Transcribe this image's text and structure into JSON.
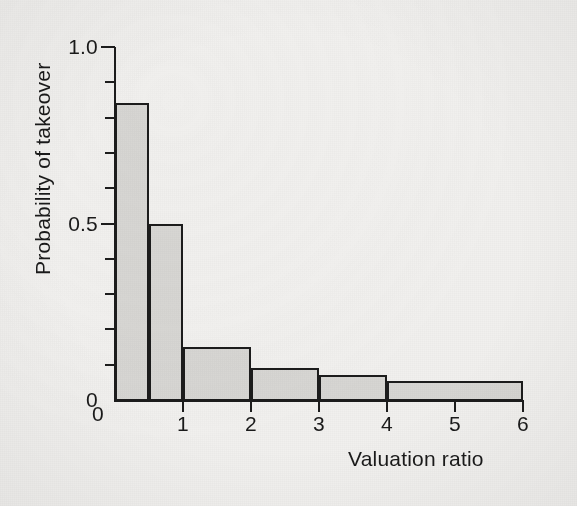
{
  "chart_data": {
    "type": "bar",
    "title": "",
    "subtitle": "",
    "xlabel": "Valuation ratio",
    "ylabel": "Probability of takeover",
    "xlim": [
      0,
      6
    ],
    "ylim": [
      0,
      1.0
    ],
    "grid": false,
    "legend": null,
    "orientation": "vertical",
    "note": "Histogram with unequal bin widths; bar value = probability of takeover for that valuation-ratio bin",
    "bins": [
      {
        "label": "0-0.5",
        "x0": 0,
        "x1": 0.5,
        "value": 0.84
      },
      {
        "label": "0.5-1",
        "x0": 0.5,
        "x1": 1,
        "value": 0.5
      },
      {
        "label": "1-2",
        "x0": 1,
        "x1": 2,
        "value": 0.15
      },
      {
        "label": "2-3",
        "x0": 2,
        "x1": 3,
        "value": 0.09
      },
      {
        "label": "3-4",
        "x0": 3,
        "x1": 4,
        "value": 0.07
      },
      {
        "label": "4-6",
        "x0": 4,
        "x1": 6,
        "value": 0.055
      }
    ],
    "categories": [
      "0-0.5",
      "0.5-1",
      "1-2",
      "2-3",
      "3-4",
      "4-6"
    ],
    "values": [
      0.84,
      0.5,
      0.15,
      0.09,
      0.07,
      0.055
    ],
    "x_ticks": [
      {
        "value": 0,
        "label": "0"
      },
      {
        "value": 1,
        "label": "1"
      },
      {
        "value": 2,
        "label": "2"
      },
      {
        "value": 3,
        "label": "3"
      },
      {
        "value": 4,
        "label": "4"
      },
      {
        "value": 5,
        "label": "5"
      },
      {
        "value": 6,
        "label": "6"
      }
    ],
    "y_ticks": [
      {
        "value": 0.0,
        "label": "0",
        "major": true
      },
      {
        "value": 0.1,
        "label": "",
        "major": false
      },
      {
        "value": 0.2,
        "label": "",
        "major": false
      },
      {
        "value": 0.3,
        "label": "",
        "major": false
      },
      {
        "value": 0.4,
        "label": "",
        "major": false
      },
      {
        "value": 0.5,
        "label": "0.5",
        "major": true
      },
      {
        "value": 0.6,
        "label": "",
        "major": false
      },
      {
        "value": 0.7,
        "label": "",
        "major": false
      },
      {
        "value": 0.8,
        "label": "",
        "major": false
      },
      {
        "value": 0.9,
        "label": "",
        "major": false
      },
      {
        "value": 1.0,
        "label": "1.0",
        "major": true
      }
    ],
    "colors": {
      "bar_fill": "#d7d6d3",
      "bar_stroke": "#1c1c1c",
      "axis": "#1c1c1c",
      "text": "#1a1a1a",
      "background": "#f1f0ee"
    }
  },
  "plot_geometry": {
    "left": 115,
    "right": 523,
    "top": 47,
    "bottom": 400
  }
}
